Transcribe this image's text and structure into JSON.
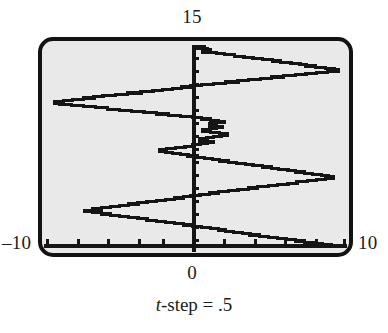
{
  "figure": {
    "name": "random-walk-step-plot",
    "labels": {
      "top": "15",
      "left": "–10",
      "right": "10",
      "bottom_axis": "0"
    },
    "caption": {
      "variable": "t",
      "rest": "-step = .5"
    },
    "colors": {
      "plot_fill": "#e9e9e9",
      "frame": "#121212",
      "ink": "#151515",
      "page": "#ffffff"
    }
  },
  "chart_data": {
    "type": "line",
    "title": "",
    "subtitle": "t-step = .5",
    "xlabel": "",
    "ylabel": "",
    "xlim": [
      -10,
      10
    ],
    "ylim": [
      0,
      15
    ],
    "grid": false,
    "legend": null,
    "x_ticks": [
      -10,
      -8,
      -6,
      -4,
      -2,
      0,
      2,
      4,
      6,
      8,
      10
    ],
    "y_ticks": [
      0,
      1,
      2,
      3,
      4,
      5,
      6,
      7,
      8,
      9,
      10,
      11,
      12,
      13,
      14,
      15
    ],
    "x_tick_labels": [
      "–10",
      "",
      "",
      "",
      "",
      "0",
      "",
      "",
      "",
      "",
      "10"
    ],
    "y_tick_labels": [
      "",
      "",
      "",
      "",
      "",
      "",
      "",
      "",
      "",
      "",
      "",
      "",
      "",
      "",
      "",
      "15"
    ],
    "annotations": [
      "15",
      "–10",
      "10",
      "0",
      "t-step = .5"
    ],
    "series": [
      {
        "name": "random-walk",
        "step": "horizontal",
        "t_step": 0.5,
        "x": [
          0.0,
          0.6,
          0.1,
          0.8,
          1.0,
          0.5,
          1.4,
          1.9,
          2.6,
          3.2,
          3.8,
          4.4,
          5.1,
          5.6,
          6.3,
          6.9,
          7.3,
          7.9,
          8.6,
          9.2,
          9.4,
          8.7,
          8.0,
          7.3,
          6.6,
          5.8,
          5.0,
          4.3,
          3.5,
          2.8,
          2.0,
          1.2,
          0.4,
          -0.3,
          -0.9,
          -1.5,
          -2.2,
          -2.8,
          -3.6,
          -4.5,
          -5.3,
          -6.1,
          -6.7,
          -7.4,
          -8.1,
          -8.7,
          -9.3,
          -9.0,
          -8.2,
          -7.4,
          -6.6,
          -5.8,
          -5.0,
          -4.2,
          -3.4,
          -2.6,
          -1.8,
          -1.0,
          -0.2,
          0.4,
          1.0,
          1.5,
          1.9,
          1.4,
          0.9,
          1.3,
          1.8,
          1.4,
          0.9,
          0.5,
          1.0,
          1.6,
          2.1,
          1.7,
          1.2,
          0.7,
          0.3,
          0.8,
          1.2,
          0.8,
          0.3,
          -0.2,
          -0.7,
          -1.3,
          -1.9,
          -2.4,
          -2.0,
          -1.5,
          -1.0,
          -0.5,
          0.1,
          0.6,
          1.1,
          1.6,
          2.2,
          2.7,
          3.3,
          3.8,
          4.4,
          5.0,
          5.5,
          6.1,
          6.6,
          7.2,
          7.7,
          8.3,
          8.8,
          9.1,
          8.6,
          8.0,
          7.4,
          6.7,
          6.1,
          5.4,
          4.8,
          4.1,
          3.5,
          2.8,
          2.2,
          1.5,
          0.9,
          0.3,
          -0.3,
          -0.8,
          -1.4,
          -2.0,
          -2.6,
          -3.2,
          -3.8,
          -4.4,
          -5.0,
          -5.6,
          -6.2,
          -6.8,
          -7.3,
          -6.8,
          -6.2,
          -5.6,
          -5.0,
          -4.4,
          -3.8,
          -3.2,
          -2.6,
          -2.0,
          -1.4,
          -0.8,
          -0.2,
          0.4,
          1.0,
          1.5,
          2.0,
          2.5,
          3.1,
          3.6,
          4.2,
          4.8,
          5.4,
          6.0,
          6.6,
          7.2,
          7.8,
          8.4,
          9.0,
          9.5
        ],
        "y": [
          15.0,
          14.8,
          14.6,
          14.4,
          14.2,
          14.0,
          13.8,
          13.6,
          13.4,
          13.2,
          13.0,
          12.8,
          12.6,
          12.4,
          12.2,
          12.0,
          11.8,
          11.6,
          11.4,
          11.2,
          11.0,
          10.8,
          10.6,
          10.4,
          10.2,
          10.0,
          9.8,
          9.6,
          9.4,
          9.2,
          9.0,
          8.8,
          8.6,
          8.4,
          8.2,
          8.0,
          7.8,
          7.6,
          7.4,
          7.2,
          7.0,
          6.8,
          6.6,
          6.4,
          6.2,
          6.0,
          5.8,
          5.6,
          5.4,
          5.2,
          5.0,
          4.8,
          4.6,
          4.4,
          4.2,
          4.0,
          3.8,
          3.6,
          3.4,
          3.2,
          3.0,
          2.8,
          2.6,
          2.4,
          2.2,
          2.0,
          1.8,
          1.6,
          1.4,
          1.2,
          1.0,
          0.8,
          0.6,
          0.4,
          0.2,
          0.0,
          -0.2,
          -0.4,
          -0.6,
          -0.8,
          -1.0,
          -1.2,
          -1.4,
          -1.6,
          -1.8,
          -2.0,
          -2.2,
          -2.4,
          -2.6,
          -2.8,
          -3.0,
          -3.2,
          -3.4,
          -3.6,
          -3.8,
          -4.0,
          -4.2,
          -4.4,
          -4.6,
          -4.8,
          -5.0,
          -5.2,
          -5.4,
          -5.6,
          -5.8,
          -6.0,
          -6.2,
          -6.4,
          -6.6,
          -6.8,
          -7.0,
          -7.2,
          -7.4,
          -7.6,
          -7.8,
          -8.0,
          -8.2,
          -8.4,
          -8.6,
          -8.8,
          -9.0,
          -9.2,
          -9.4,
          -9.6,
          -9.8,
          -10.0,
          -10.2,
          -10.4,
          -10.6,
          -10.8,
          -11.0,
          -11.2,
          -11.4,
          -11.6,
          -11.8,
          -12.0,
          -12.2,
          -12.4,
          -12.6,
          -12.8,
          -13.0,
          -13.2,
          -13.4,
          -13.6,
          -13.8,
          -14.0,
          -14.2,
          -14.4,
          -14.6,
          -14.8,
          -15.0,
          -15.2,
          -15.4,
          -15.6,
          -15.8,
          -16.0,
          -16.2,
          -16.4,
          -16.6,
          -16.8,
          -17.0,
          -17.2,
          -17.4,
          -17.6
        ]
      }
    ]
  }
}
